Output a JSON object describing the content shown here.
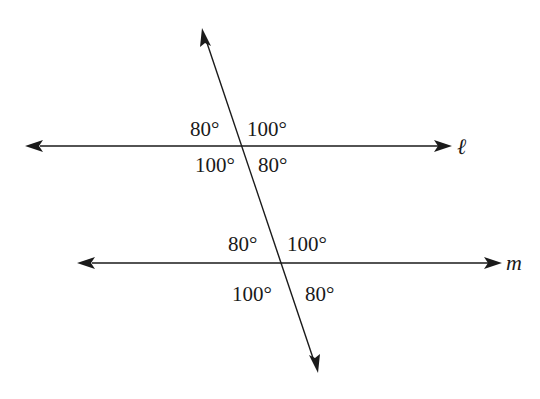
{
  "diagram": {
    "lines": {
      "l": {
        "label": "ℓ",
        "y": 146,
        "x1": 25,
        "x2": 452
      },
      "m": {
        "label": "m",
        "y": 263,
        "x1": 77,
        "x2": 502
      },
      "transversal": {
        "x1": 202,
        "y1": 28,
        "x2": 318,
        "y2": 373
      }
    },
    "angles_l": {
      "top_left": "80°",
      "top_right": "100°",
      "bottom_left": "100°",
      "bottom_right": "80°"
    },
    "angles_m": {
      "top_left": "80°",
      "top_right": "100°",
      "bottom_left": "100°",
      "bottom_right": "80°"
    },
    "colors": {
      "line": "#1a1a1a",
      "background": "#ffffff"
    }
  }
}
